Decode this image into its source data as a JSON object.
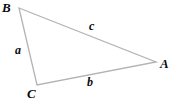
{
  "figure": {
    "background_color": "#ffffff",
    "stroke_color": "#b3b3b6",
    "text_color": "#0a0a0a",
    "width": 174,
    "height": 105
  },
  "vertices": [
    {
      "label": "B",
      "x": 19,
      "y": 8
    },
    {
      "label": "A",
      "x": 156,
      "y": 62
    },
    {
      "label": "C",
      "x": 37,
      "y": 85
    }
  ],
  "sides": [
    {
      "label": "a",
      "from": "B",
      "to": "C"
    },
    {
      "label": "b",
      "from": "C",
      "to": "A"
    },
    {
      "label": "c",
      "from": "B",
      "to": "A"
    }
  ],
  "chart_data": {
    "type": "diagram",
    "subtype": "triangle",
    "points": {
      "B": [
        19,
        8
      ],
      "A": [
        156,
        62
      ],
      "C": [
        37,
        85
      ]
    },
    "edges": [
      {
        "name": "a",
        "endpoints": [
          "B",
          "C"
        ]
      },
      {
        "name": "b",
        "endpoints": [
          "C",
          "A"
        ]
      },
      {
        "name": "c",
        "endpoints": [
          "B",
          "A"
        ]
      }
    ],
    "vertex_labels": [
      "A",
      "B",
      "C"
    ],
    "edge_labels": [
      "a",
      "b",
      "c"
    ],
    "grid": false,
    "legend": "none"
  }
}
